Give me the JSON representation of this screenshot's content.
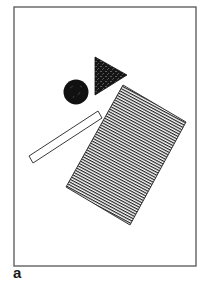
{
  "figure": {
    "panel_label": "a",
    "frame": {
      "x": 14,
      "y": 7,
      "width": 182,
      "height": 259,
      "stroke": "#555555"
    },
    "shapes": [
      {
        "type": "triangle",
        "fill": "speckled-dark",
        "points": [
          [
            95,
            57
          ],
          [
            95,
            95
          ],
          [
            127,
            75
          ]
        ]
      },
      {
        "type": "circle",
        "fill": "#111111",
        "cx": 76,
        "cy": 92,
        "r": 12.5
      },
      {
        "type": "bar",
        "fill": "none",
        "points": [
          [
            29,
            156
          ],
          [
            33,
            163
          ],
          [
            102,
            118
          ],
          [
            98,
            111
          ]
        ]
      },
      {
        "type": "rectangle",
        "fill": "hatched",
        "points": [
          [
            123,
            85
          ],
          [
            186,
            122
          ],
          [
            130,
            225
          ],
          [
            66,
            187
          ]
        ]
      }
    ],
    "colors": {
      "ink": "#111111",
      "frame": "#555555",
      "background": "#ffffff"
    }
  }
}
